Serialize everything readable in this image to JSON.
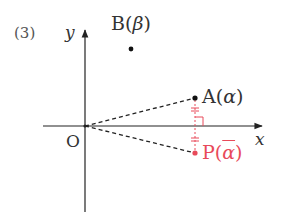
{
  "problem_number": "(3)",
  "axes": {
    "x_label": "x",
    "y_label": "y",
    "origin_label": "O"
  },
  "points": {
    "A": {
      "name": "A",
      "open": "(",
      "arg": "α",
      "close": ")"
    },
    "B": {
      "name": "B",
      "open": "(",
      "arg": "β",
      "close": ")"
    },
    "P": {
      "name": "P",
      "open": "(",
      "arg": "α",
      "close": ")"
    }
  },
  "colors": {
    "axis": "#222222",
    "point_black": "#111111",
    "accent_red": "#e84a5a"
  }
}
